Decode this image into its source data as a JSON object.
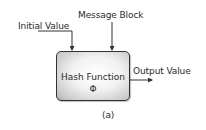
{
  "diagram": {
    "inputs": {
      "initial_value": "Initial Value",
      "message_block": "Message Block"
    },
    "function_box": {
      "title": "Hash Function",
      "symbol": "Φ"
    },
    "output": {
      "label": "Output Value"
    },
    "caption": "(a)",
    "colors": {
      "stroke": "#333333",
      "box_fill_center": "#ffffff",
      "box_fill_edge": "#a8a8a8"
    }
  }
}
